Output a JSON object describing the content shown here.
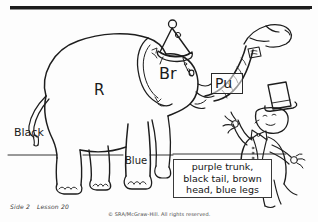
{
  "page": {
    "background_color": "#ffffff",
    "ink_color": "#1d1d1d"
  },
  "rule": {
    "present": true
  },
  "artwork": {
    "scene_description": "line-art elephant wearing a party hat with a ringmaster clown",
    "figures": [
      {
        "name": "elephant",
        "accessory": "party hat with pom-pom and chin strap"
      },
      {
        "name": "ringmaster-clown",
        "accessory": "top hat, bow tie, vest, tails coat"
      }
    ],
    "ground_line": true
  },
  "labels": [
    {
      "id": "r",
      "text": "R",
      "target": "body"
    },
    {
      "id": "br",
      "text": "Br",
      "target": "head"
    },
    {
      "id": "pu",
      "text": "Pu",
      "target": "trunk",
      "boxed": true
    },
    {
      "id": "black",
      "text": "Black",
      "target": "tail"
    },
    {
      "id": "blue",
      "text": "Blue",
      "target": "legs"
    }
  ],
  "instruction_box": {
    "line1": "purple trunk,",
    "line2": "black tail, brown",
    "line3": "head, blue legs",
    "full_text": "purple trunk, black tail, brown head, blue legs"
  },
  "footer": {
    "side": "Side 2",
    "lesson": "Lesson 20",
    "copyright": "© SRA/McGraw-Hill.  All rights reserved."
  }
}
